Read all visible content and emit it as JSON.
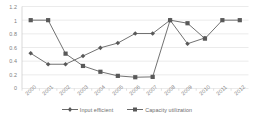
{
  "chart_data": {
    "type": "line",
    "title": "",
    "xlabel": "",
    "ylabel": "",
    "grid": true,
    "legend_position": "bottom",
    "categories": [
      "2000",
      "2001",
      "2002",
      "2003",
      "2004",
      "2005",
      "2006",
      "2007",
      "2008",
      "2009",
      "2010",
      "2011",
      "2012"
    ],
    "ylim": [
      0,
      1.2
    ],
    "yticks": [
      "0",
      "0.2",
      "0.4",
      "0.6",
      "0.8",
      "1",
      "1.2"
    ],
    "ytick_values": [
      0,
      0.2,
      0.4,
      0.6,
      0.8,
      1,
      1.2
    ],
    "series": [
      {
        "name": "Input efficient",
        "marker": "diamond",
        "color": "#595959",
        "values": [
          0.515,
          0.355,
          0.355,
          0.475,
          0.595,
          0.665,
          0.805,
          0.805,
          1.0,
          0.655,
          0.74,
          null,
          null
        ]
      },
      {
        "name": "Capacity utilization",
        "marker": "square",
        "color": "#595959",
        "values": [
          1.0,
          1.0,
          0.51,
          0.33,
          0.245,
          0.185,
          0.165,
          0.17,
          1.0,
          0.955,
          0.73,
          1.0,
          1.0
        ]
      }
    ]
  },
  "legend": {
    "items": [
      {
        "label": "Input efficient",
        "marker": "diamond-marker-icon"
      },
      {
        "label": "Capacity utilization",
        "marker": "square-marker-icon"
      }
    ]
  },
  "axis": {
    "y_labels": [
      "1.2",
      "1",
      "0.8",
      "0.6",
      "0.4",
      "0.2",
      "0"
    ],
    "x_labels": [
      "2000",
      "2001",
      "2002",
      "2003",
      "2004",
      "2005",
      "2006",
      "2007",
      "2008",
      "2009",
      "2010",
      "2011",
      "2012"
    ]
  },
  "colors": {
    "series_line": "#595959",
    "grid": "#e2e2e2",
    "axis_text": "#808080",
    "background": "#ffffff"
  }
}
